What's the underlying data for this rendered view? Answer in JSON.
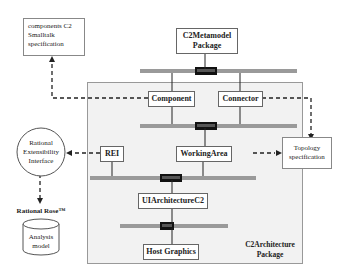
{
  "diagram": {
    "title_package": {
      "line1": "C2Metamodel",
      "line2": "Package"
    },
    "arch_package": {
      "line1": "C2Architecture",
      "line2": "Package"
    },
    "components": {
      "component": "Component",
      "connector": "Connector",
      "rei": "REI",
      "working_area": "WorkingArea",
      "ui_architecture": "UIArchitectureC2",
      "host_graphics": "Host Graphics"
    },
    "notes": {
      "smalltalk": {
        "line1": "components C2",
        "line2": "Smalltalk",
        "line3": "specification"
      },
      "topology": {
        "line1": "Topology",
        "line2": "specification"
      }
    },
    "interface": {
      "line1": "Rational",
      "line2": "Extensibility",
      "line3": "Interface"
    },
    "tool_label": "Rational Rose™",
    "database": {
      "line1": "Analysis",
      "line2": "model"
    },
    "colors": {
      "bus": "#9a9a9a",
      "bus_joint": "#111111",
      "package_bg": "#f2f2f2",
      "line": "#222222"
    }
  }
}
